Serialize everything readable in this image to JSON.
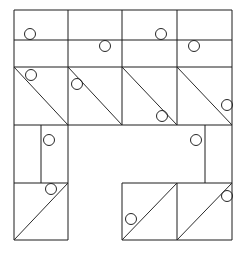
{
  "figure": {
    "canvas": {
      "width": 247,
      "height": 255
    },
    "colors": {
      "background": "#ffffff",
      "line": "#1d1d1d",
      "diagonal": "#2a2a2a",
      "circle": "#262626"
    },
    "stroke_width": 1,
    "circle_radius": 5.5
  },
  "chart_data": {
    "type": "diagram",
    "xlabel": "",
    "ylabel": "",
    "grid": {
      "column_x": [
        14,
        68,
        122,
        177,
        232
      ],
      "row_y": [
        10,
        40,
        67,
        125,
        183,
        240
      ]
    },
    "bounds": {
      "left": 14,
      "top": 10,
      "right": 232,
      "bottom": 240
    },
    "segments": [
      {
        "name": "row1-top",
        "x1": 14,
        "y1": 10,
        "x2": 232,
        "y2": 10
      },
      {
        "name": "row1-bottom",
        "x1": 14,
        "y1": 40,
        "x2": 232,
        "y2": 40
      },
      {
        "name": "row2-bottom",
        "x1": 14,
        "y1": 67,
        "x2": 232,
        "y2": 67
      },
      {
        "name": "row3-bottom",
        "x1": 14,
        "y1": 125,
        "x2": 232,
        "y2": 125
      },
      {
        "name": "row4-bottom-left",
        "x1": 14,
        "y1": 183,
        "x2": 68,
        "y2": 183
      },
      {
        "name": "row4-bottom-right",
        "x1": 122,
        "y1": 183,
        "x2": 232,
        "y2": 183
      },
      {
        "name": "row5-bottom-left",
        "x1": 14,
        "y1": 240,
        "x2": 68,
        "y2": 240
      },
      {
        "name": "row5-bottom-right",
        "x1": 122,
        "y1": 240,
        "x2": 232,
        "y2": 240
      },
      {
        "name": "col1-left-full",
        "x1": 14,
        "y1": 10,
        "x2": 14,
        "y2": 240
      },
      {
        "name": "col2-line-upper",
        "x1": 68,
        "y1": 10,
        "x2": 68,
        "y2": 240
      },
      {
        "name": "col3-line-upper",
        "x1": 122,
        "y1": 10,
        "x2": 122,
        "y2": 125
      },
      {
        "name": "col3-line-lower",
        "x1": 122,
        "y1": 183,
        "x2": 122,
        "y2": 240
      },
      {
        "name": "col4-line-upper",
        "x1": 177,
        "y1": 10,
        "x2": 177,
        "y2": 125
      },
      {
        "name": "col4-line-lower",
        "x1": 177,
        "y1": 183,
        "x2": 177,
        "y2": 240
      },
      {
        "name": "col5-right-upper",
        "x1": 232,
        "y1": 10,
        "x2": 232,
        "y2": 240
      },
      {
        "name": "subdiv-left-row4",
        "x1": 41,
        "y1": 125,
        "x2": 41,
        "y2": 183
      },
      {
        "name": "subdiv-right-row4",
        "x1": 205,
        "y1": 125,
        "x2": 205,
        "y2": 183
      }
    ],
    "diagonals": [
      {
        "name": "r3c1-backslash",
        "x1": 14,
        "y1": 67,
        "x2": 68,
        "y2": 125
      },
      {
        "name": "r3c2-backslash",
        "x1": 68,
        "y1": 67,
        "x2": 122,
        "y2": 125
      },
      {
        "name": "r3c3-backslash",
        "x1": 122,
        "y1": 67,
        "x2": 177,
        "y2": 125
      },
      {
        "name": "r3c4-backslash",
        "x1": 177,
        "y1": 67,
        "x2": 232,
        "y2": 125
      },
      {
        "name": "r5c1-slash",
        "x1": 14,
        "y1": 240,
        "x2": 68,
        "y2": 183
      },
      {
        "name": "r5c3-slash",
        "x1": 122,
        "y1": 240,
        "x2": 177,
        "y2": 183
      },
      {
        "name": "r5c4-slash",
        "x1": 177,
        "y1": 240,
        "x2": 232,
        "y2": 183
      }
    ],
    "circles": [
      {
        "name": "circle-r1c1",
        "cx": 30,
        "cy": 34,
        "r": 5.5
      },
      {
        "name": "circle-r2c2",
        "cx": 105,
        "cy": 46,
        "r": 5.5
      },
      {
        "name": "circle-r1c3",
        "cx": 161,
        "cy": 34,
        "r": 5.5
      },
      {
        "name": "circle-r2c4",
        "cx": 194,
        "cy": 46,
        "r": 5.5
      },
      {
        "name": "circle-r3c1",
        "cx": 31,
        "cy": 75,
        "r": 5.5
      },
      {
        "name": "circle-r3c2",
        "cx": 77,
        "cy": 84,
        "r": 5.5
      },
      {
        "name": "circle-r3c3",
        "cx": 162,
        "cy": 116,
        "r": 5.5
      },
      {
        "name": "circle-r3c4",
        "cx": 227,
        "cy": 105,
        "r": 5.5
      },
      {
        "name": "circle-r4c1",
        "cx": 49,
        "cy": 140,
        "r": 5.5
      },
      {
        "name": "circle-r4c4",
        "cx": 196,
        "cy": 140,
        "r": 5.5
      },
      {
        "name": "circle-r5c1",
        "cx": 51,
        "cy": 189,
        "r": 5.5
      },
      {
        "name": "circle-r5c3",
        "cx": 131,
        "cy": 219,
        "r": 5.5
      },
      {
        "name": "circle-r5c4",
        "cx": 227,
        "cy": 196,
        "r": 5.5
      }
    ],
    "counts": {
      "segments": 17,
      "diagonals": 7,
      "circles": 13
    }
  }
}
